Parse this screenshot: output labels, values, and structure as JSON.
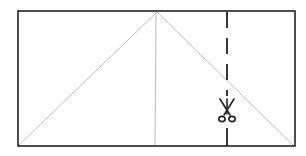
{
  "diagram": {
    "canvas": {
      "width": 306,
      "height": 156
    },
    "colors": {
      "outline": "#222222",
      "fold_line": "#bbbbbb",
      "cut_line": "#222222",
      "background": "#ffffff"
    },
    "rectangle": {
      "x1": 18,
      "y1": 11,
      "x2": 295,
      "y2": 146
    },
    "apex": {
      "x": 157,
      "y": 12
    },
    "fold_lines": [
      {
        "name": "left-diagonal",
        "x1": 157,
        "y1": 12,
        "x2": 19,
        "y2": 145
      },
      {
        "name": "center-vertical",
        "x1": 156,
        "y1": 12,
        "x2": 155,
        "y2": 146
      },
      {
        "name": "right-diagonal",
        "x1": 157,
        "y1": 12,
        "x2": 294,
        "y2": 146
      }
    ],
    "cut_line": {
      "x": 227,
      "y1": 12,
      "y2": 146,
      "dash": "16 10"
    },
    "scissors": {
      "x": 227,
      "y": 113,
      "orientation": "up",
      "icon": "scissors-icon"
    }
  }
}
